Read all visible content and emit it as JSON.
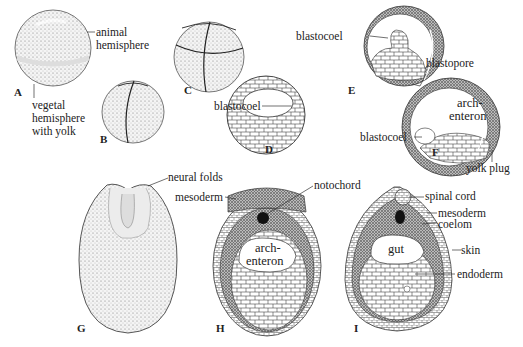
{
  "figure": {
    "topic": "Frog embryo development: cleavage, gastrulation, neurulation",
    "panels": [
      {
        "id": "A",
        "labels": [
          "animal hemisphere",
          "vegetal hemisphere with yolk"
        ]
      },
      {
        "id": "B",
        "labels": []
      },
      {
        "id": "C",
        "labels": []
      },
      {
        "id": "D",
        "labels": [
          "blastocoel"
        ]
      },
      {
        "id": "E",
        "labels": [
          "blastocoel",
          "blastopore"
        ]
      },
      {
        "id": "F",
        "labels": [
          "arch-enteron",
          "blastocoel",
          "yolk plug"
        ]
      },
      {
        "id": "G",
        "labels": [
          "neural folds"
        ]
      },
      {
        "id": "H",
        "labels": [
          "mesoderm",
          "notochord",
          "arch-enteron"
        ]
      },
      {
        "id": "I",
        "labels": [
          "spinal cord",
          "mesoderm",
          "coelom",
          "gut",
          "skin",
          "endoderm"
        ]
      }
    ]
  },
  "labels": {
    "animal1": "animal",
    "animal2": "hemisphere",
    "vegetal1": "vegetal",
    "vegetal2": "hemisphere",
    "vegetal3": "with yolk",
    "blastocoel_d": "blastocoel",
    "blastocoel_e": "blastocoel",
    "blastopore": "blastopore",
    "archenteron_f1": "arch-",
    "archenteron_f2": "enteron",
    "blastocoel_f": "blastocoel",
    "yolk_plug": "yolk plug",
    "neural_folds": "neural folds",
    "mesoderm_h": "mesoderm",
    "notochord": "notochord",
    "archenteron_h1": "arch-",
    "archenteron_h2": "enteron",
    "spinal_cord": "spinal cord",
    "mesoderm_i": "mesoderm",
    "coelom": "coelom",
    "gut": "gut",
    "skin": "skin",
    "endoderm": "endoderm"
  },
  "panel_letters": {
    "A": "A",
    "B": "B",
    "C": "C",
    "D": "D",
    "E": "E",
    "F": "F",
    "G": "G",
    "H": "H",
    "I": "I"
  }
}
